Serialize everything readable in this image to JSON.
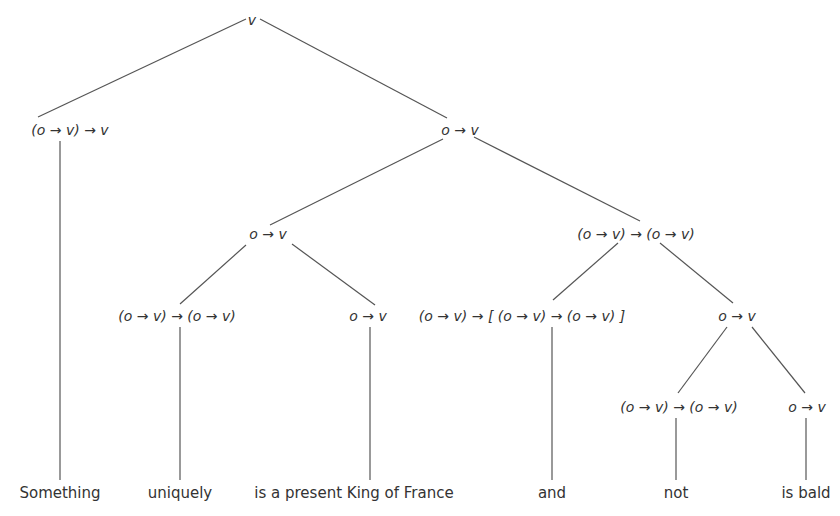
{
  "diagram": {
    "type": "semantic type tree",
    "nodes": {
      "root": "v",
      "something_type": "(o → v) → v",
      "vp": "o → v",
      "vp_left": "o → v",
      "conj_phrase": "(o → v) → (o → v)",
      "uniquely_type": "(o → v) → (o → v)",
      "king_type": "o → v",
      "and_type": "(o → v) → [ (o → v) → (o → v) ]",
      "not_bald": "o → v",
      "not_type": "(o → v) → (o → v)",
      "bald_type": "o → v"
    },
    "leaves": {
      "something": "Something",
      "uniquely": "uniquely",
      "king": "is a present King of France",
      "and": "and",
      "not": "not",
      "bald": "is bald"
    }
  }
}
